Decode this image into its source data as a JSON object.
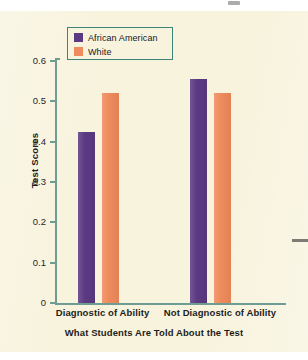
{
  "figure": {
    "background_color": "#f8f3dd",
    "axis_color": "#6f9c92",
    "legend_border_color": "#3d8578"
  },
  "legend": {
    "entries": [
      {
        "label": "African American",
        "color": "#5b3a83",
        "swatch_name": "legend-swatch-african-american"
      },
      {
        "label": "White",
        "color": "#ef8b5c",
        "swatch_name": "legend-swatch-white"
      }
    ]
  },
  "axes": {
    "y_title": "Test Scores",
    "x_title": "What Students Are Told About the Test",
    "y_ticks": [
      "0.6",
      "0.5",
      "0.4",
      "0.3",
      "0.2",
      "0.1",
      "0"
    ]
  },
  "chart_data": {
    "type": "bar",
    "title": "",
    "subtitle": "",
    "xlabel": "What Students Are Told About the Test",
    "ylabel": "Test Scores",
    "categories": [
      "Diagnostic of Ability",
      "Not Diagnostic of Ability"
    ],
    "series": [
      {
        "name": "African American",
        "color": "#5b3a83",
        "values": [
          0.425,
          0.555
        ]
      },
      {
        "name": "White",
        "color": "#ef8b5c",
        "values": [
          0.52,
          0.52
        ]
      }
    ],
    "ylim": [
      0,
      0.6
    ],
    "yticks": [
      0,
      0.1,
      0.2,
      0.3,
      0.4,
      0.5,
      0.6
    ],
    "ytick_labels": [
      "0",
      "0.1",
      "0.2",
      "0.3",
      "0.4",
      "0.5",
      "0.6"
    ],
    "grid": false,
    "legend_position": "upper left"
  }
}
